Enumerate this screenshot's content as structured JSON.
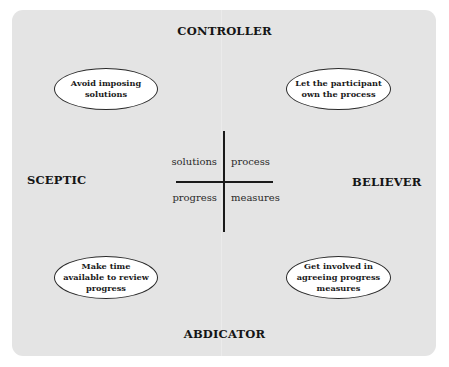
{
  "diagram": {
    "type": "quadrant-matrix",
    "axes": {
      "top": "CONTROLLER",
      "bottom": "ABDICATOR",
      "left": "SCEPTIC",
      "right": "BELIEVER"
    },
    "quadrants": {
      "top_left": {
        "ellipse_text": "Avoid imposing solutions",
        "center_word": "solutions"
      },
      "top_right": {
        "ellipse_text": "Let the participant own the process",
        "center_word": "process"
      },
      "bottom_left": {
        "ellipse_text": "Make time available to review progress",
        "center_word": "progress"
      },
      "bottom_right": {
        "ellipse_text": "Get involved in agreeing progress measures",
        "center_word": "measures"
      }
    },
    "colors": {
      "background": "#e4e4e4",
      "ellipse_fill": "#ffffff",
      "ink": "#1a1a1a"
    }
  }
}
